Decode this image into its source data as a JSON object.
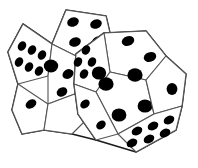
{
  "image": {
    "title": "Two dodecahedral dice",
    "subject": "pair-of-twelve-sided-dice-line-art",
    "style": "black-outline-white-fill",
    "width": 198,
    "height": 168
  },
  "colors": {
    "background": "#ffffff",
    "face_fill": "#ffffff",
    "outline": "#1a1a1a",
    "inner_edge": "#555555",
    "pip": "#000000"
  },
  "stroke": {
    "outline_width": 1.6,
    "inner_width": 1.1
  },
  "dice": [
    {
      "name": "left-die",
      "faces": [
        {
          "name": "top-face",
          "pip_count": 4,
          "polygon": "66,10 106,16 112,42 80,58 52,44",
          "pips": [
            {
              "cx": 73,
              "cy": 22,
              "rx": 6.0,
              "ry": 4.6,
              "rot": -22
            },
            {
              "cx": 96,
              "cy": 24,
              "rx": 6.0,
              "ry": 4.6,
              "rot": -22
            },
            {
              "cx": 75,
              "cy": 42,
              "rx": 6.0,
              "ry": 4.6,
              "rot": -22
            },
            {
              "cx": 98,
              "cy": 41,
              "rx": 6.0,
              "ry": 4.6,
              "rot": -22
            }
          ]
        },
        {
          "name": "upper-left-face",
          "pip_count": 6,
          "polygon": "23,24 52,44 48,76 18,84 8,52",
          "pips": [
            {
              "cx": 22,
              "cy": 46,
              "rx": 5.0,
              "ry": 4.0,
              "rot": -58
            },
            {
              "cx": 32,
              "cy": 50,
              "rx": 5.0,
              "ry": 4.0,
              "rot": -58
            },
            {
              "cx": 42,
              "cy": 55,
              "rx": 5.0,
              "ry": 4.0,
              "rot": -58
            },
            {
              "cx": 19,
              "cy": 62,
              "rx": 5.0,
              "ry": 4.0,
              "rot": -58
            },
            {
              "cx": 29,
              "cy": 67,
              "rx": 5.0,
              "ry": 4.0,
              "rot": -58
            },
            {
              "cx": 39,
              "cy": 71,
              "rx": 5.0,
              "ry": 4.0,
              "rot": -58
            }
          ]
        },
        {
          "name": "front-center-face",
          "pip_count": 3,
          "polygon": "52,44 80,58 80,92 48,104 48,76",
          "pips": [
            {
              "cx": 51,
              "cy": 66,
              "rx": 7.2,
              "ry": 6.4,
              "rot": 0
            },
            {
              "cx": 68,
              "cy": 74,
              "rx": 5.8,
              "ry": 4.6,
              "rot": -30
            },
            {
              "cx": 62,
              "cy": 92,
              "rx": 5.6,
              "ry": 4.4,
              "rot": -30
            }
          ]
        },
        {
          "name": "lower-left-face",
          "pip_count": 2,
          "polygon": "18,84 48,104 44,130 22,134 12,110",
          "pips": [
            {
              "cx": 31,
              "cy": 104,
              "rx": 5.8,
              "ry": 4.2,
              "rot": -32
            },
            {
              "cx": 52,
              "cy": 124,
              "rx": 5.8,
              "ry": 4.2,
              "rot": -32
            }
          ]
        },
        {
          "name": "bottom-front-face",
          "pip_count": 2,
          "polygon": "48,104 80,92 88,118 72,134 44,130",
          "pips": []
        }
      ]
    },
    {
      "name": "right-die",
      "faces": [
        {
          "name": "top-face",
          "pip_count": 2,
          "polygon": "104,33 146,31 166,56 146,80 110,72",
          "pips": [
            {
              "cx": 128,
              "cy": 41,
              "rx": 6.4,
              "ry": 4.8,
              "rot": -18
            },
            {
              "cx": 150,
              "cy": 57,
              "rx": 6.4,
              "ry": 4.8,
              "rot": -18
            }
          ]
        },
        {
          "name": "left-upper-face",
          "pip_count": 5,
          "polygon": "76,54 104,33 110,72 96,92 74,84",
          "pips": [
            {
              "cx": 86,
              "cy": 50,
              "rx": 5.0,
              "ry": 4.0,
              "rot": -60
            },
            {
              "cx": 92,
              "cy": 62,
              "rx": 5.0,
              "ry": 4.0,
              "rot": -60
            },
            {
              "cx": 78,
              "cy": 62,
              "rx": 5.0,
              "ry": 4.0,
              "rot": -60
            },
            {
              "cx": 84,
              "cy": 74,
              "rx": 5.0,
              "ry": 4.0,
              "rot": -60
            },
            {
              "cx": 99,
              "cy": 73,
              "rx": 7.2,
              "ry": 6.6,
              "rot": 0
            }
          ]
        },
        {
          "name": "front-large-face",
          "pip_count": 5,
          "polygon": "96,92 110,72 146,80 154,114 118,134",
          "pips": [
            {
              "cx": 106,
              "cy": 84,
              "rx": 7.6,
              "ry": 6.8,
              "rot": 0
            },
            {
              "cx": 135,
              "cy": 75,
              "rx": 7.6,
              "ry": 6.8,
              "rot": 0
            },
            {
              "cx": 145,
              "cy": 106,
              "rx": 7.4,
              "ry": 6.6,
              "rot": 0
            },
            {
              "cx": 119,
              "cy": 115,
              "rx": 7.4,
              "ry": 6.6,
              "rot": 0
            },
            {
              "cx": 95,
              "cy": 108,
              "rx": 6.4,
              "ry": 5.4,
              "rot": 0
            }
          ]
        },
        {
          "name": "right-face",
          "pip_count": 1,
          "polygon": "146,80 166,56 186,74 182,106 154,114",
          "pips": [
            {
              "cx": 172,
              "cy": 89,
              "rx": 5.4,
              "ry": 6.0,
              "rot": 0
            }
          ]
        },
        {
          "name": "bottom-right-face",
          "pip_count": 6,
          "polygon": "118,134 154,114 182,106 176,130 136,152",
          "pips": [
            {
              "cx": 137,
              "cy": 131,
              "rx": 5.6,
              "ry": 4.0,
              "rot": -28
            },
            {
              "cx": 153,
              "cy": 126,
              "rx": 5.6,
              "ry": 4.0,
              "rot": -28
            },
            {
              "cx": 169,
              "cy": 120,
              "rx": 5.6,
              "ry": 4.0,
              "rot": -28
            },
            {
              "cx": 132,
              "cy": 143,
              "rx": 5.6,
              "ry": 4.0,
              "rot": -28
            },
            {
              "cx": 149,
              "cy": 139,
              "rx": 5.6,
              "ry": 4.0,
              "rot": -28
            },
            {
              "cx": 165,
              "cy": 133,
              "rx": 5.6,
              "ry": 4.0,
              "rot": -28
            }
          ]
        },
        {
          "name": "lower-left-small-face",
          "pip_count": 2,
          "polygon": "74,84 96,92 118,134 96,140 78,114",
          "pips": [
            {
              "cx": 85,
              "cy": 104,
              "rx": 5.2,
              "ry": 4.0,
              "rot": -40
            },
            {
              "cx": 101,
              "cy": 125,
              "rx": 5.2,
              "ry": 4.0,
              "rot": -40
            }
          ]
        }
      ]
    }
  ],
  "outlines": {
    "left_die_silhouette": "66,10 106,16 112,42 146,31 166,56 186,74 182,106 176,130 136,152 96,140 72,134 22,134 12,110 8,52 23,24",
    "left_die_body": "66,10 106,16 112,42 110,72 96,92 118,134 96,140 72,134 44,130 22,134 12,110 18,84 8,52 23,24 52,44",
    "right_die_body": "104,33 146,31 166,56 186,74 182,106 176,130 136,152 96,140 78,114 74,84 76,54"
  }
}
